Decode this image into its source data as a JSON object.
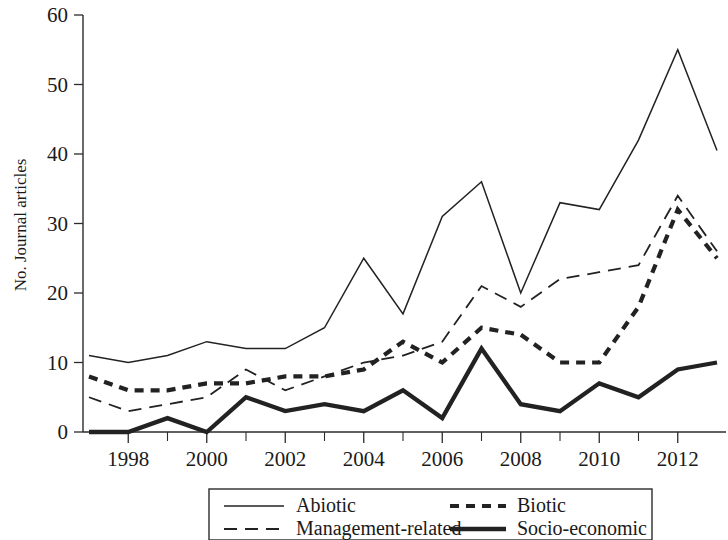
{
  "chart_data": {
    "type": "line",
    "title": "",
    "xlabel": "",
    "ylabel": "No. Journal articles",
    "xlim": [
      1997,
      2013
    ],
    "ylim": [
      0,
      60
    ],
    "grid": false,
    "legend_position": "bottom",
    "x": [
      1997,
      1998,
      1999,
      2000,
      2001,
      2002,
      2003,
      2004,
      2005,
      2006,
      2007,
      2008,
      2009,
      2010,
      2011,
      2012,
      2013
    ],
    "xticks": [
      1998,
      2000,
      2002,
      2004,
      2006,
      2008,
      2010,
      2012
    ],
    "xtick_labels": [
      "1998",
      "2000",
      "2002",
      "2004",
      "2006",
      "2008",
      "2010",
      "2012"
    ],
    "yticks": [
      0,
      10,
      20,
      30,
      40,
      50,
      60
    ],
    "ytick_labels": [
      "0",
      "10",
      "20",
      "30",
      "40",
      "50",
      "60"
    ],
    "series": [
      {
        "name": "Abiotic",
        "style": "thin-solid",
        "values": [
          11,
          10,
          11,
          13,
          12,
          12,
          15,
          25,
          17,
          31,
          36,
          20,
          33,
          32,
          42,
          55,
          40.5
        ]
      },
      {
        "name": "Biotic",
        "style": "thick-dashed",
        "values": [
          8,
          6,
          6,
          7,
          7,
          8,
          8,
          9,
          13,
          10,
          15,
          14,
          10,
          10,
          18,
          32,
          25
        ]
      },
      {
        "name": "Management-related",
        "style": "thin-long-dashed",
        "values": [
          5,
          3,
          4,
          5,
          9,
          6,
          8,
          10,
          11,
          13,
          21,
          18,
          22,
          23,
          24,
          34,
          26
        ]
      },
      {
        "name": "Socio-economic",
        "style": "thick-solid",
        "values": [
          0,
          0,
          2,
          0,
          5,
          3,
          4,
          3,
          6,
          2,
          12,
          4,
          3,
          7,
          5,
          9,
          10
        ]
      }
    ]
  },
  "legend": {
    "entries": [
      {
        "label": "Abiotic",
        "style": "thin-solid"
      },
      {
        "label": "Biotic",
        "style": "thick-dashed"
      },
      {
        "label": "Management-related",
        "style": "thin-long-dashed"
      },
      {
        "label": "Socio-economic",
        "style": "thick-solid"
      }
    ]
  },
  "colors": {
    "line": "#222222",
    "axis": "#2b2b2b",
    "background": "#ffffff"
  }
}
